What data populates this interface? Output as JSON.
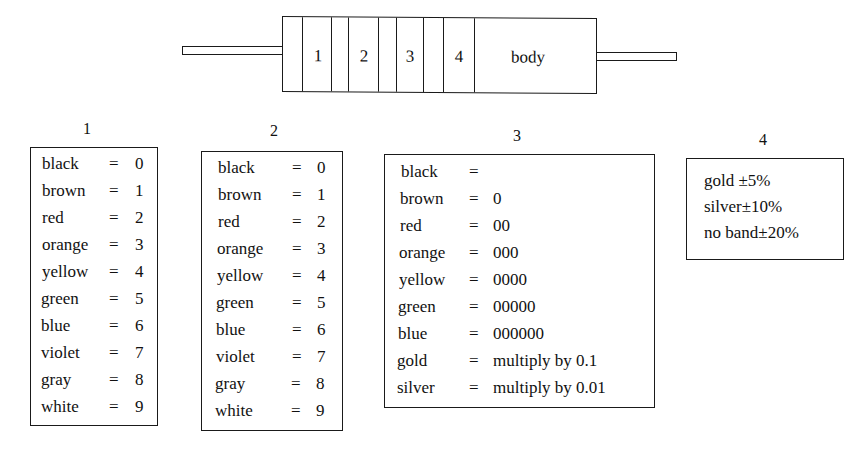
{
  "diagram": {
    "resistor": {
      "band_labels": [
        "1",
        "2",
        "3",
        "4"
      ],
      "body_label": "body"
    },
    "panels": [
      {
        "title": "1",
        "rows": [
          {
            "color": "black",
            "eq": "=",
            "value": "0"
          },
          {
            "color": "brown",
            "eq": "=",
            "value": "1"
          },
          {
            "color": "red",
            "eq": "=",
            "value": "2"
          },
          {
            "color": "orange",
            "eq": "=",
            "value": "3"
          },
          {
            "color": "yellow",
            "eq": "=",
            "value": "4"
          },
          {
            "color": "green",
            "eq": "=",
            "value": "5"
          },
          {
            "color": "blue",
            "eq": "=",
            "value": "6"
          },
          {
            "color": "violet",
            "eq": "=",
            "value": "7"
          },
          {
            "color": "gray",
            "eq": "=",
            "value": "8"
          },
          {
            "color": "white",
            "eq": "=",
            "value": "9"
          }
        ]
      },
      {
        "title": "2",
        "rows": [
          {
            "color": "black",
            "eq": "=",
            "value": "0"
          },
          {
            "color": "brown",
            "eq": "=",
            "value": "1"
          },
          {
            "color": "red",
            "eq": "=",
            "value": "2"
          },
          {
            "color": "orange",
            "eq": "=",
            "value": "3"
          },
          {
            "color": "yellow",
            "eq": "=",
            "value": "4"
          },
          {
            "color": "green",
            "eq": "=",
            "value": "5"
          },
          {
            "color": "blue",
            "eq": "=",
            "value": "6"
          },
          {
            "color": "violet",
            "eq": "=",
            "value": "7"
          },
          {
            "color": "gray",
            "eq": "=",
            "value": "8"
          },
          {
            "color": "white",
            "eq": "=",
            "value": "9"
          }
        ]
      },
      {
        "title": "3",
        "rows": [
          {
            "color": "black",
            "eq": "=",
            "value": ""
          },
          {
            "color": "brown",
            "eq": "=",
            "value": "0"
          },
          {
            "color": "red",
            "eq": "=",
            "value": "00"
          },
          {
            "color": "orange",
            "eq": "=",
            "value": "000"
          },
          {
            "color": "yellow",
            "eq": "=",
            "value": "0000"
          },
          {
            "color": "green",
            "eq": "=",
            "value": "00000"
          },
          {
            "color": "blue",
            "eq": "=",
            "value": "000000"
          },
          {
            "color": "gold",
            "eq": "=",
            "value": "multiply by 0.1"
          },
          {
            "color": "silver",
            "eq": "=",
            "value": "multiply by 0.01"
          }
        ]
      },
      {
        "title": "4",
        "rows": [
          {
            "text": "gold ±5%"
          },
          {
            "text": "silver±10%"
          },
          {
            "text": "no band±20%"
          }
        ]
      }
    ]
  }
}
